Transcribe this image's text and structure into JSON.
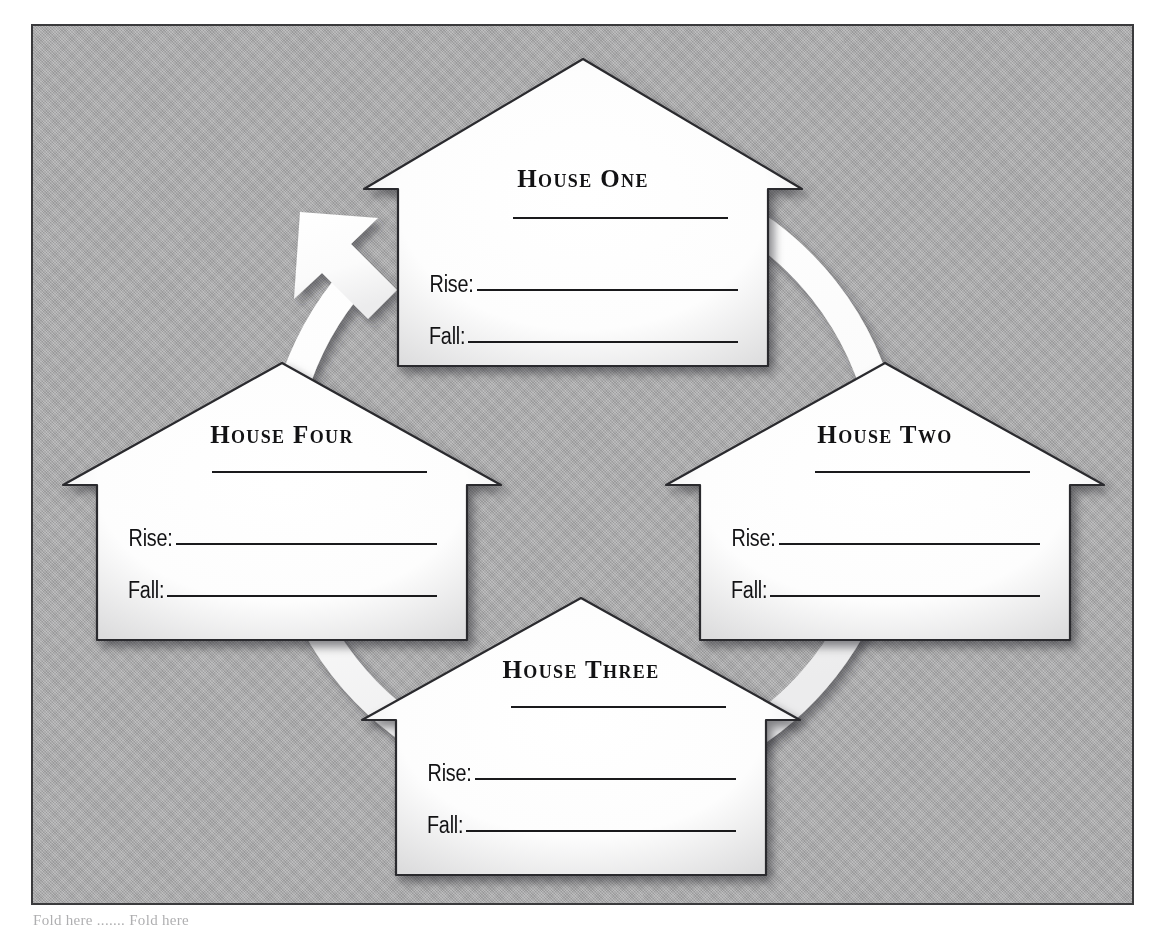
{
  "worksheet": {
    "panel_background": "#a9a9aa",
    "border_color": "#3a3a3c",
    "caption": "Fold here ....... Fold here"
  },
  "cycle": {
    "arrow_color": "#ffffff",
    "direction": "clockwise",
    "arrowhead_label": "cycle-arrowhead"
  },
  "houses": [
    {
      "id": "house-one",
      "title": "House One",
      "title_rule": "",
      "fields": [
        {
          "label": "Rise:",
          "value": ""
        },
        {
          "label": "Fall:",
          "value": ""
        }
      ]
    },
    {
      "id": "house-two",
      "title": "House Two",
      "title_rule": "",
      "fields": [
        {
          "label": "Rise:",
          "value": ""
        },
        {
          "label": "Fall:",
          "value": ""
        }
      ]
    },
    {
      "id": "house-three",
      "title": "House Three",
      "title_rule": "",
      "fields": [
        {
          "label": "Rise:",
          "value": ""
        },
        {
          "label": "Fall:",
          "value": ""
        }
      ]
    },
    {
      "id": "house-four",
      "title": "House Four",
      "title_rule": "",
      "fields": [
        {
          "label": "Rise:",
          "value": ""
        },
        {
          "label": "Fall:",
          "value": ""
        }
      ]
    }
  ]
}
